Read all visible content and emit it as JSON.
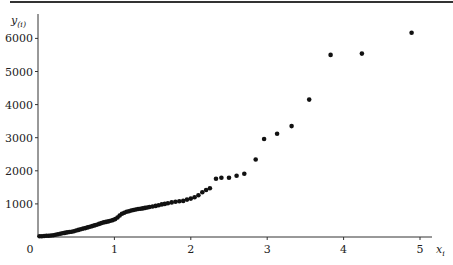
{
  "chart_data": {
    "type": "scatter",
    "title": "",
    "xlabel": "x_i",
    "ylabel": "y_(i)",
    "xlim": [
      0,
      5.2
    ],
    "ylim": [
      0,
      6500
    ],
    "grid": false,
    "legend": null,
    "x_ticks": [
      "0",
      "1",
      "2",
      "3",
      "4",
      "5"
    ],
    "y_ticks": [
      "1000",
      "2000",
      "3000",
      "4000",
      "5000",
      "6000"
    ],
    "series": [
      {
        "name": "ordered observations",
        "points": [
          [
            0.02,
            20
          ],
          [
            0.05,
            25
          ],
          [
            0.08,
            30
          ],
          [
            0.11,
            35
          ],
          [
            0.14,
            40
          ],
          [
            0.17,
            45
          ],
          [
            0.2,
            55
          ],
          [
            0.23,
            70
          ],
          [
            0.26,
            85
          ],
          [
            0.29,
            100
          ],
          [
            0.32,
            115
          ],
          [
            0.35,
            125
          ],
          [
            0.38,
            140
          ],
          [
            0.41,
            150
          ],
          [
            0.44,
            160
          ],
          [
            0.47,
            175
          ],
          [
            0.5,
            195
          ],
          [
            0.53,
            215
          ],
          [
            0.56,
            235
          ],
          [
            0.59,
            255
          ],
          [
            0.62,
            270
          ],
          [
            0.65,
            290
          ],
          [
            0.68,
            310
          ],
          [
            0.71,
            330
          ],
          [
            0.74,
            350
          ],
          [
            0.77,
            370
          ],
          [
            0.8,
            395
          ],
          [
            0.83,
            420
          ],
          [
            0.86,
            440
          ],
          [
            0.89,
            455
          ],
          [
            0.92,
            470
          ],
          [
            0.95,
            490
          ],
          [
            0.98,
            510
          ],
          [
            1.01,
            540
          ],
          [
            1.04,
            590
          ],
          [
            1.07,
            650
          ],
          [
            1.1,
            700
          ],
          [
            1.13,
            730
          ],
          [
            1.16,
            760
          ],
          [
            1.19,
            780
          ],
          [
            1.22,
            800
          ],
          [
            1.25,
            815
          ],
          [
            1.28,
            830
          ],
          [
            1.31,
            845
          ],
          [
            1.34,
            855
          ],
          [
            1.37,
            865
          ],
          [
            1.4,
            880
          ],
          [
            1.43,
            890
          ],
          [
            1.46,
            905
          ],
          [
            1.5,
            920
          ],
          [
            1.54,
            940
          ],
          [
            1.58,
            960
          ],
          [
            1.62,
            985
          ],
          [
            1.66,
            1000
          ],
          [
            1.7,
            1020
          ],
          [
            1.75,
            1045
          ],
          [
            1.8,
            1065
          ],
          [
            1.85,
            1080
          ],
          [
            1.9,
            1090
          ],
          [
            1.95,
            1130
          ],
          [
            2.0,
            1160
          ],
          [
            2.05,
            1200
          ],
          [
            2.1,
            1260
          ],
          [
            2.15,
            1350
          ],
          [
            2.2,
            1420
          ],
          [
            2.25,
            1470
          ],
          [
            2.33,
            1760
          ],
          [
            2.4,
            1790
          ],
          [
            2.5,
            1790
          ],
          [
            2.6,
            1850
          ],
          [
            2.7,
            1910
          ],
          [
            2.85,
            2340
          ],
          [
            2.96,
            2960
          ],
          [
            3.13,
            3120
          ],
          [
            3.32,
            3350
          ],
          [
            3.55,
            4150
          ],
          [
            3.83,
            5500
          ],
          [
            4.24,
            5540
          ],
          [
            4.89,
            6170
          ]
        ]
      }
    ],
    "marker": {
      "shape": "circle",
      "color": "#111111",
      "size": 4
    }
  },
  "axes": {
    "color": "#333333"
  }
}
